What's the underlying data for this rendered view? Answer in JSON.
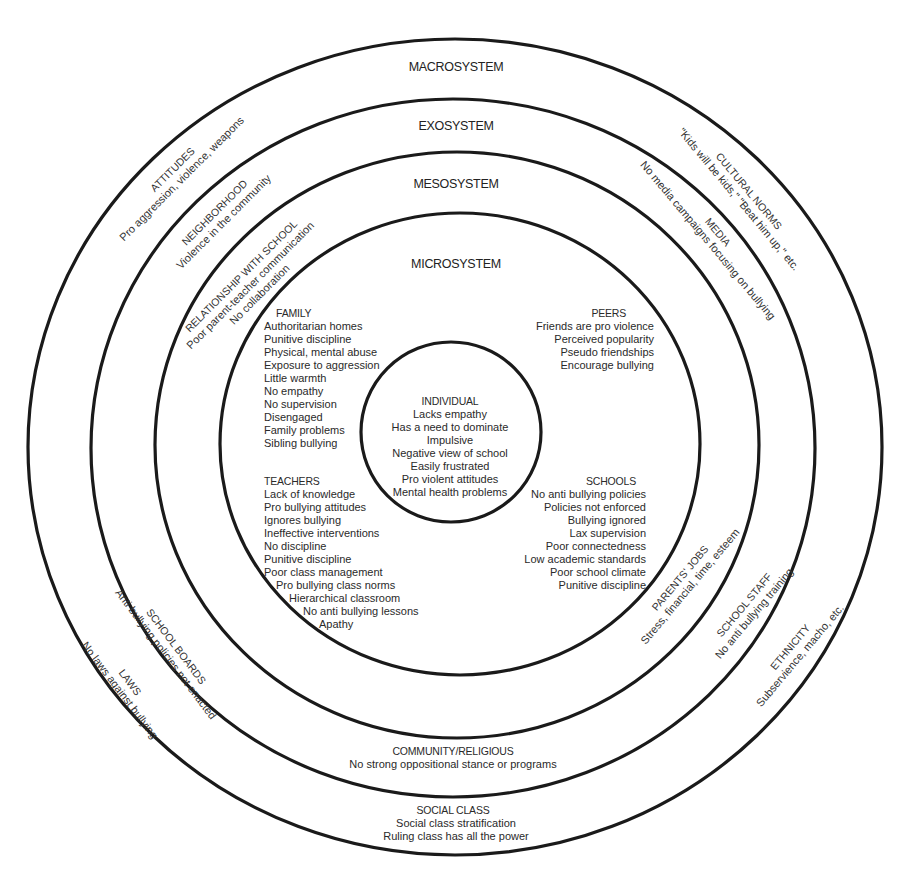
{
  "diagram": {
    "systems": {
      "macro": "MACROSYSTEM",
      "exo": "EXOSYSTEM",
      "meso": "MESOSYSTEM",
      "micro": "MICROSYSTEM"
    },
    "individual": {
      "title": "INDIVIDUAL",
      "items": [
        "Lacks empathy",
        "Has a need to dominate",
        "Impulsive",
        "Negative view of school",
        "Easily frustrated",
        "Pro violent attitudes",
        "Mental health problems"
      ]
    },
    "microsystem": {
      "family": {
        "title": "FAMILY",
        "items": [
          "Authoritarian homes",
          "Punitive discipline",
          "Physical, mental abuse",
          "Exposure to aggression",
          "Little warmth",
          "No empathy",
          "No supervision",
          "Disengaged",
          "Family problems",
          "Sibling bullying"
        ]
      },
      "peers": {
        "title": "PEERS",
        "items": [
          "Friends are pro violence",
          "Perceived popularity",
          "Pseudo friendships",
          "Encourage bullying"
        ]
      },
      "teachers": {
        "title": "TEACHERS",
        "items": [
          "Lack of knowledge",
          "Pro bullying attitudes",
          "Ignores bullying",
          "Ineffective interventions",
          "No discipline",
          "Punitive discipline",
          "Poor class management",
          "Pro bullying class norms",
          "Hierarchical classroom",
          "No anti bullying lessons",
          "Apathy"
        ]
      },
      "schools": {
        "title": "SCHOOLS",
        "items": [
          "No anti bullying policies",
          "Policies not enforced",
          "Bullying ignored",
          "Lax supervision",
          "Poor connectedness",
          "Low academic standards",
          "Poor school climate",
          "Punitive discipline"
        ]
      }
    },
    "mesosystem": {
      "relationship_with_school": {
        "title": "RELATIONSHIP WITH SCHOOL",
        "items": [
          "Poor parent-teacher communication",
          "No collaboration"
        ]
      },
      "parents_jobs": {
        "title": "PARENTS' JOBS",
        "items": [
          "Stress, financial, time, esteem"
        ]
      }
    },
    "exosystem": {
      "neighborhood": {
        "title": "NEIGHBORHOOD",
        "items": [
          "Violence in the community"
        ]
      },
      "media": {
        "title": "MEDIA",
        "items": [
          "No media campaigns focusing on bullying"
        ]
      },
      "school_boards": {
        "title": "SCHOOL BOARDS",
        "items": [
          "Anti bullying policies not enacted"
        ]
      },
      "school_staff": {
        "title": "SCHOOL STAFF",
        "items": [
          "No anti bullying training"
        ]
      },
      "community_religious": {
        "title": "COMMUNITY/RELIGIOUS",
        "items": [
          "No strong oppositional stance or programs"
        ]
      }
    },
    "macrosystem": {
      "attitudes": {
        "title": "ATTITUDES",
        "items": [
          "Pro aggression, violence, weapons"
        ]
      },
      "cultural_norms": {
        "title": "CULTURAL NORMS",
        "items": [
          "\"Kids will be kids,\" \"Beat him up,\" etc."
        ]
      },
      "laws": {
        "title": "LAWS",
        "items": [
          "No laws against bullying"
        ]
      },
      "ethnicity": {
        "title": "ETHNICITY",
        "items": [
          "Subservience, macho, etc."
        ]
      },
      "social_class": {
        "title": "SOCIAL CLASS",
        "items": [
          "Social class stratification",
          "Ruling class has all the power"
        ]
      }
    },
    "colors": {
      "ring_stroke": "#1a1a1a",
      "text": "#2a2a2a",
      "background": "#ffffff"
    }
  }
}
